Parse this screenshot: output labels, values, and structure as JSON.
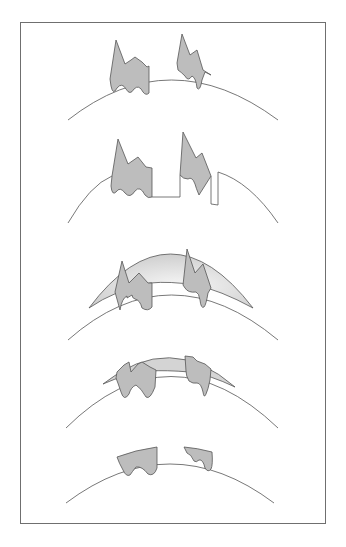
{
  "figure": {
    "title": "Five-step diagram of curved surface with two irregular lesions",
    "panels": [
      {
        "step": 1,
        "label": "Two irregular grey lesions protruding from curved surface"
      },
      {
        "step": 2,
        "label": "Lesions with rectangular excision cuts below the surface"
      },
      {
        "step": 3,
        "label": "Shaded dome layer applied over lesions and surface"
      },
      {
        "step": 4,
        "label": "Dome layer flattened with lesions embedded"
      },
      {
        "step": 5,
        "label": "Lesions remaining within surface after dome removed"
      }
    ],
    "colors": {
      "lesion_fill": "#bdbdbd",
      "dome_fill": "#d4d4d4",
      "dome_highlight": "#f7f7f7",
      "outline": "#555555",
      "frame": "#6f6f6f"
    }
  }
}
